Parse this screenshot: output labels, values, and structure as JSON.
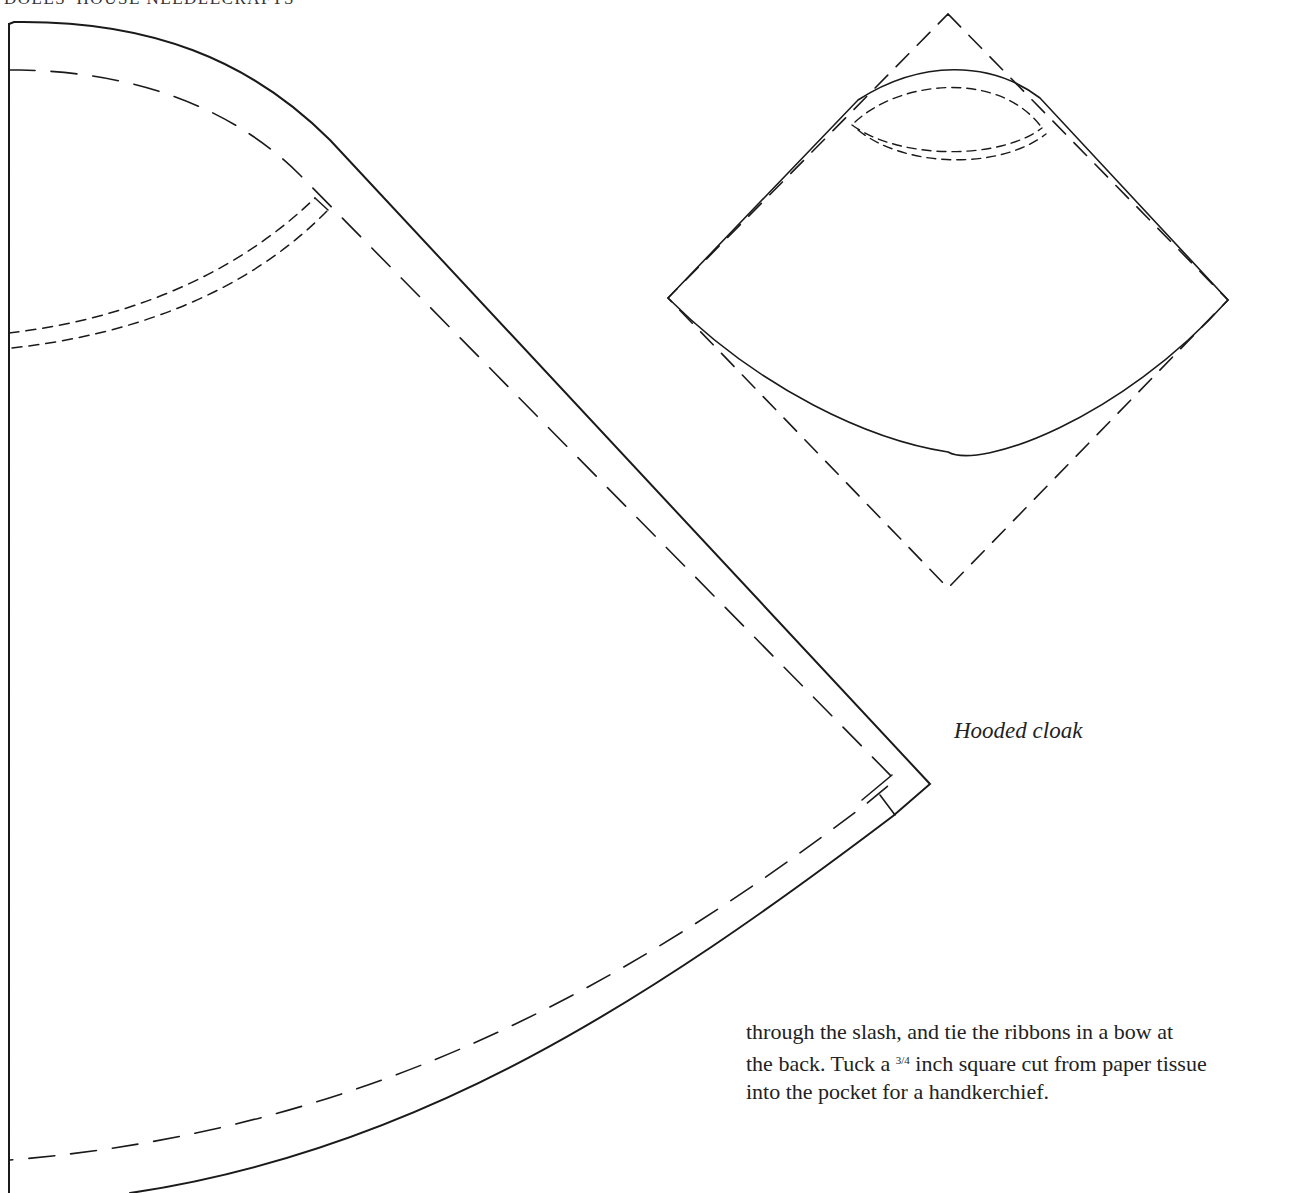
{
  "page": {
    "running_head": "DOLLS' HOUSE NEEDLECRAFTS"
  },
  "figure": {
    "caption": "Hooded cloak",
    "pieces": [
      {
        "name": "cloak-body",
        "description": "Large quarter-circle cloak pattern with solid cutting line and dashed seam allowance, neck curve dashed"
      },
      {
        "name": "hood",
        "description": "Small fan-shaped hood pattern inside dashed square, with dashed neck curve"
      }
    ]
  },
  "body_text": {
    "line1": "through the slash, and tie the ribbons in a bow at",
    "line2_pre": "the back. Tuck a ",
    "line2_frac": "3/4",
    "line2_post": " inch square cut from paper tissue",
    "line3": "into the pocket for a handkerchief."
  }
}
